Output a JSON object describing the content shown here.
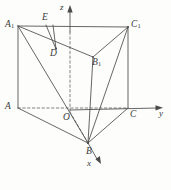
{
  "figure": {
    "type": "geometry-diagram",
    "background_color": "#fdfdfc",
    "stroke_color": "#4a4a4a",
    "label_color": "#3a3a3a",
    "caption": ""
  },
  "axes": {
    "origin_label": "O",
    "z_label": "z",
    "y_label": "y",
    "x_label": "x",
    "z_axis": {
      "from": [
        70,
        112
      ],
      "to": [
        70,
        6
      ],
      "style": "solid-with-dashed-segment",
      "arrow": true
    },
    "y_axis": {
      "from": [
        70,
        112
      ],
      "to": [
        162,
        108
      ],
      "style": "solid",
      "arrow": true
    },
    "x_axis": {
      "from": [
        70,
        112
      ],
      "to": [
        101,
        164
      ],
      "style": "solid",
      "arrow": true
    }
  },
  "vertices": [
    {
      "name": "A1",
      "label": "A",
      "sub": "1",
      "x": 18,
      "y": 26,
      "label_x": 5,
      "label_y": 20
    },
    {
      "name": "C1",
      "label": "C",
      "sub": "1",
      "x": 128,
      "y": 27,
      "label_x": 131,
      "label_y": 20
    },
    {
      "name": "B1",
      "label": "B",
      "sub": "1",
      "x": 93,
      "y": 57,
      "label_x": 92,
      "label_y": 58
    },
    {
      "name": "A",
      "label": "A",
      "sub": "",
      "x": 18,
      "y": 108,
      "label_x": 5,
      "label_y": 102
    },
    {
      "name": "C",
      "label": "C",
      "sub": "",
      "x": 128,
      "y": 108,
      "label_x": 130,
      "label_y": 110
    },
    {
      "name": "B",
      "label": "B",
      "sub": "",
      "x": 88,
      "y": 143,
      "label_x": 86,
      "label_y": 147
    },
    {
      "name": "O",
      "label": "O",
      "sub": "",
      "x": 70,
      "y": 112,
      "label_x": 64,
      "label_y": 113
    },
    {
      "name": "D",
      "label": "D",
      "sub": "",
      "x": 55,
      "y": 48,
      "label_x": 52,
      "label_y": 49
    },
    {
      "name": "E",
      "label": "E",
      "sub": "",
      "x": 47,
      "y": 26,
      "label_x": 41,
      "label_y": 14
    }
  ],
  "edges": [
    {
      "name": "A1-C1",
      "from": "A1",
      "to": "C1",
      "style": "solid"
    },
    {
      "name": "A1-B1",
      "from": "A1",
      "to": "B1",
      "style": "solid"
    },
    {
      "name": "B1-C1",
      "from": "B1",
      "to": "C1",
      "style": "solid"
    },
    {
      "name": "A1-A",
      "from": "A1",
      "to": "A",
      "style": "solid"
    },
    {
      "name": "C1-C",
      "from": "C1",
      "to": "C",
      "style": "solid"
    },
    {
      "name": "B1-B",
      "from": "B1",
      "to": "B",
      "style": "solid"
    },
    {
      "name": "A-B",
      "from": "A",
      "to": "B",
      "style": "solid"
    },
    {
      "name": "B-C",
      "from": "B",
      "to": "C",
      "style": "solid"
    },
    {
      "name": "A-C",
      "from": "A",
      "to": "C",
      "style": "dashed"
    },
    {
      "name": "A1-B",
      "from": "A1",
      "to": "B",
      "style": "solid"
    },
    {
      "name": "C1-B",
      "from": "C1",
      "to": "B",
      "style": "solid"
    },
    {
      "name": "E-D",
      "from": "E",
      "to": "D",
      "style": "solid"
    },
    {
      "name": "E-D2",
      "from": "E2",
      "to": "D",
      "style": "solid"
    },
    {
      "name": "O-B",
      "from": "O",
      "to": "B",
      "style": "dashed"
    }
  ]
}
